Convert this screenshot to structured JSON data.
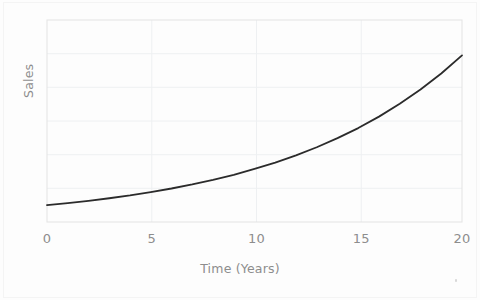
{
  "figure": {
    "background_color": "#fdfdfd",
    "page_edge_color": "#f4f4f4"
  },
  "axes": {
    "x_title": "Time (Years)",
    "y_title": "Sales",
    "x_tick_labels": [
      "0",
      "5",
      "10",
      "15",
      "20"
    ],
    "y_tick_labels": [],
    "tick_label_color": "#8d8d8d",
    "axis_title_color": "#8d8d8d",
    "spine_color": "#e3e3e3",
    "grid_color": "#eef0f2"
  },
  "chart_data": {
    "type": "line",
    "title": "",
    "subtitle": "",
    "xlabel": "Time (Years)",
    "ylabel": "Sales",
    "xlim": [
      0,
      20
    ],
    "ylim": [
      0,
      120
    ],
    "xticks": [
      0,
      5,
      10,
      15,
      20
    ],
    "yticks": [
      0,
      20,
      40,
      60,
      80,
      100,
      120
    ],
    "ytick_labels_shown": false,
    "grid": true,
    "grid_axis": "both",
    "legend": false,
    "legend_position": "none",
    "annotations": [],
    "series": [
      {
        "name": "Sales",
        "color": "#2b2b2b",
        "line_width": 1.8,
        "description": "smooth exponential growth curve, approximately y = 10 * exp(0.115 * x)",
        "x": [
          0,
          1,
          2,
          3,
          4,
          5,
          6,
          7,
          8,
          9,
          10,
          11,
          12,
          13,
          14,
          15,
          16,
          17,
          18,
          19,
          20
        ],
        "values": [
          10.0,
          11.2,
          12.6,
          14.1,
          15.8,
          17.8,
          19.9,
          22.3,
          25.0,
          28.0,
          31.5,
          35.3,
          39.6,
          44.4,
          49.8,
          55.8,
          62.6,
          70.2,
          78.7,
          88.2,
          99.0
        ]
      }
    ]
  },
  "artifacts": {
    "scan_speck": "•"
  }
}
